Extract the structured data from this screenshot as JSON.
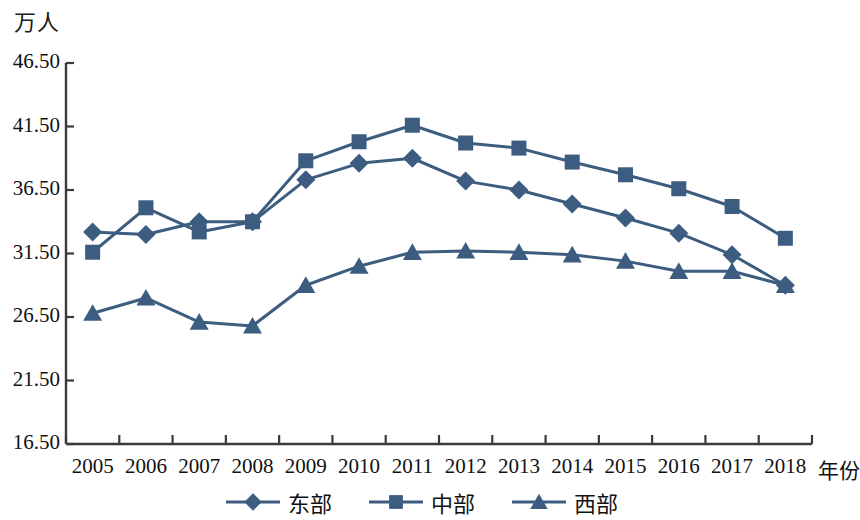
{
  "chart_data": {
    "type": "line",
    "title": "",
    "unit_label": "万人",
    "xlabel": "年份",
    "ylabel": "万人",
    "grid": false,
    "legend_position": "bottom",
    "categories": [
      "2005",
      "2006",
      "2007",
      "2008",
      "2009",
      "2010",
      "2011",
      "2012",
      "2013",
      "2014",
      "2015",
      "2016",
      "2017",
      "2018"
    ],
    "x": [
      2005,
      2006,
      2007,
      2008,
      2009,
      2010,
      2011,
      2012,
      2013,
      2014,
      2015,
      2016,
      2017,
      2018
    ],
    "ylim": [
      16.5,
      46.5
    ],
    "ytick_labels": [
      "46.50",
      "41.50",
      "36.50",
      "31.50",
      "26.50",
      "21.50",
      "16.50"
    ],
    "yticks": [
      46.5,
      41.5,
      36.5,
      31.5,
      26.5,
      21.5,
      16.5
    ],
    "series": [
      {
        "name": "东部",
        "marker": "diamond",
        "color": "#3d5d80",
        "values": [
          33.2,
          33.0,
          34.0,
          34.0,
          37.3,
          38.6,
          39.0,
          37.2,
          36.5,
          35.4,
          34.3,
          33.1,
          31.4,
          29.0
        ]
      },
      {
        "name": "中部",
        "marker": "square",
        "color": "#3d5d80",
        "values": [
          31.6,
          35.1,
          33.2,
          34.0,
          38.8,
          40.3,
          41.6,
          40.2,
          39.8,
          38.7,
          37.7,
          36.6,
          35.2,
          32.7
        ]
      },
      {
        "name": "西部",
        "marker": "triangle",
        "color": "#3d5d80",
        "values": [
          26.8,
          28.0,
          26.1,
          25.8,
          29.0,
          30.5,
          31.6,
          31.7,
          31.6,
          31.4,
          30.9,
          30.1,
          30.1,
          29.0
        ]
      }
    ]
  },
  "axis": {
    "unit_label": "万人",
    "xaxis_title": "年份",
    "y_labels": [
      "46.50",
      "41.50",
      "36.50",
      "31.50",
      "26.50",
      "21.50",
      "16.50"
    ],
    "x_labels": [
      "2005",
      "2006",
      "2007",
      "2008",
      "2009",
      "2010",
      "2011",
      "2012",
      "2013",
      "2014",
      "2015",
      "2016",
      "2017",
      "2018"
    ],
    "axis_color": "#3a3a3a"
  },
  "legend": {
    "items": [
      {
        "label": "东部",
        "marker": "diamond"
      },
      {
        "label": "中部",
        "marker": "square"
      },
      {
        "label": "西部",
        "marker": "triangle"
      }
    ]
  },
  "style": {
    "series_color": "#3d5d80",
    "background": "#ffffff"
  }
}
